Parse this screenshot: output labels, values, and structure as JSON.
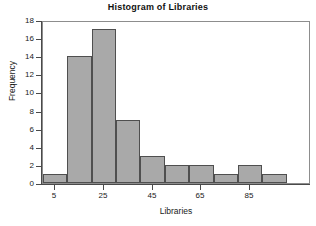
{
  "chart_data": {
    "type": "bar",
    "title": "Histogram of Libraries",
    "xlabel": "Libraries",
    "ylabel": "Frequency",
    "bin_width": 10,
    "bin_starts": [
      0,
      10,
      20,
      30,
      40,
      50,
      60,
      70,
      80,
      90
    ],
    "categories": [
      "0-10",
      "10-20",
      "20-30",
      "30-40",
      "40-50",
      "50-60",
      "60-70",
      "70-80",
      "80-90",
      "90-100"
    ],
    "values": [
      1,
      14,
      17,
      7,
      3,
      2,
      2,
      1,
      2,
      1
    ],
    "xlim": [
      0,
      110
    ],
    "ylim": [
      0,
      18
    ],
    "xticks": [
      5,
      25,
      45,
      65,
      85
    ],
    "xtick_labels": [
      "5",
      "25",
      "45",
      "65",
      "85"
    ],
    "yticks": [
      0,
      2,
      4,
      6,
      8,
      10,
      12,
      14,
      16,
      18
    ],
    "ytick_labels": [
      "0",
      "2",
      "4",
      "6",
      "8",
      "10",
      "12",
      "14",
      "16",
      "18"
    ],
    "grid": false,
    "legend": "none",
    "bar_color": "#a9a9a9",
    "bar_edge_color": "#4f4f4f",
    "axis_color": "#4a4a4a",
    "background": "#ffffff"
  }
}
